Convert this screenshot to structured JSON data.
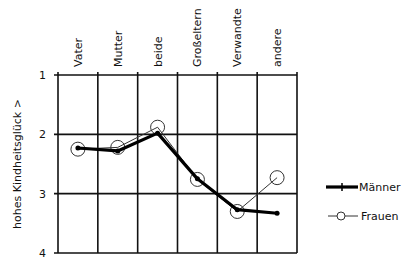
{
  "chart_data": {
    "type": "line",
    "title": "",
    "xlabel": "",
    "ylabel": "hohes Kindheitsglück >",
    "categories": [
      "Vater",
      "Mutter",
      "beide",
      "Großeltern",
      "Verwandte",
      "andere"
    ],
    "series": [
      {
        "name": "Männer",
        "values": [
          2.23,
          2.28,
          1.98,
          2.75,
          3.27,
          3.33
        ],
        "style": "thick line, small filled markers"
      },
      {
        "name": "Frauen",
        "values": [
          2.25,
          2.22,
          1.88,
          2.76,
          3.3,
          2.73
        ],
        "style": "thin line, open circle markers"
      }
    ],
    "yticks": [
      1,
      2,
      3,
      4
    ],
    "ylim": [
      1,
      4
    ],
    "y_inverted": true,
    "grid": true,
    "legend_position": "right"
  }
}
